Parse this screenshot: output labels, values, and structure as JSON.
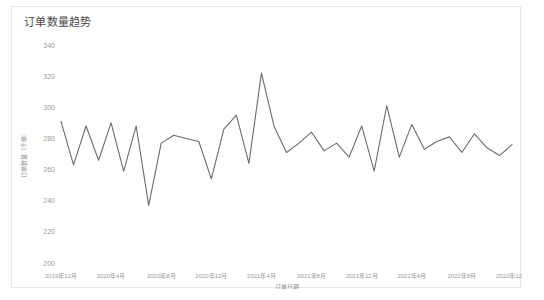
{
  "card": {
    "title": "订单数量趋势"
  },
  "chart_data": {
    "type": "line",
    "title": "订单数量趋势",
    "xlabel": "订单日期",
    "ylabel": "订单数量（千单）",
    "grid": false,
    "legend": "none",
    "line_color": "#6b6b6b",
    "ylim": [
      200,
      340
    ],
    "ytick_labels": [
      "340",
      "320",
      "300",
      "280",
      "260",
      "240",
      "220",
      "200"
    ],
    "ytick_values": [
      340,
      320,
      300,
      280,
      260,
      240,
      220,
      200
    ],
    "xtick_labels": [
      "2019年12月",
      "2020年4月",
      "2020年8月",
      "2020年12月",
      "2021年4月",
      "2021年8月",
      "2021年12月",
      "2022年4月",
      "2022年8月",
      "2022年12月"
    ],
    "xtick_indices": [
      0,
      4,
      8,
      12,
      16,
      20,
      24,
      28,
      32,
      36
    ],
    "series": [
      {
        "name": "订单数量",
        "x": [
          "2019年12月",
          "2020年1月",
          "2020年2月",
          "2020年3月",
          "2020年4月",
          "2020年5月",
          "2020年6月",
          "2020年7月",
          "2020年8月",
          "2020年9月",
          "2020年10月",
          "2020年11月",
          "2020年12月",
          "2021年1月",
          "2021年2月",
          "2021年3月",
          "2021年4月",
          "2021年5月",
          "2021年6月",
          "2021年7月",
          "2021年8月",
          "2021年9月",
          "2021年10月",
          "2021年11月",
          "2021年12月",
          "2022年1月",
          "2022年2月",
          "2022年3月",
          "2022年4月",
          "2022年5月",
          "2022年6月",
          "2022年7月",
          "2022年8月",
          "2022年9月",
          "2022年10月",
          "2022年11月",
          "2022年12月"
        ],
        "values": [
          291,
          263,
          288,
          266,
          290,
          259,
          288,
          237,
          277,
          282,
          280,
          278,
          254,
          286,
          295,
          264,
          322,
          288,
          271,
          277,
          284,
          272,
          277,
          268,
          288,
          259,
          301,
          268,
          289,
          273,
          278,
          281,
          271,
          283,
          274,
          269,
          276
        ]
      }
    ]
  }
}
